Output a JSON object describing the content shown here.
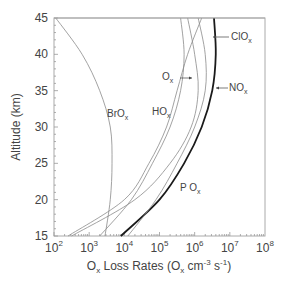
{
  "chart_data": {
    "type": "line",
    "title": "",
    "xlabel": "Ox Loss Rates (Ox cm-3 s-1)",
    "xlabel_parts": {
      "main": "O",
      "sub": "x",
      "rest": " Loss Rates  (O",
      "sub2": "x",
      "rest2": " cm",
      "sup": "-3",
      "rest3": " s",
      "sup2": "-1",
      "end": ")"
    },
    "ylabel": "Altitude (km)",
    "xscale": "log",
    "xlim": [
      100,
      100000000
    ],
    "ylim": [
      15,
      45
    ],
    "x_ticks": [
      {
        "base": "10",
        "exp": "2"
      },
      {
        "base": "10",
        "exp": "3"
      },
      {
        "base": "10",
        "exp": "4"
      },
      {
        "base": "10",
        "exp": "5"
      },
      {
        "base": "10",
        "exp": "6"
      },
      {
        "base": "10",
        "exp": "7"
      },
      {
        "base": "10",
        "exp": "8"
      }
    ],
    "y_ticks": [
      "15",
      "20",
      "25",
      "30",
      "35",
      "40",
      "45"
    ],
    "grid": false,
    "legend": "inline labels",
    "altitudes_km": [
      15,
      20,
      25,
      30,
      35,
      40,
      45
    ],
    "series": [
      {
        "name": "P Ox",
        "label_main": "P O",
        "label_sub": "x",
        "style": "thick",
        "log10_values": [
          3.9,
          5.0,
          5.7,
          6.2,
          6.5,
          6.6,
          6.55
        ]
      },
      {
        "name": "BrOx",
        "label_main": "BrO",
        "label_sub": "x",
        "style": "thin",
        "log10_values": [
          3.45,
          3.6,
          3.65,
          3.6,
          3.3,
          2.8,
          2.05
        ]
      },
      {
        "name": "ClOx",
        "label_main": "ClO",
        "label_sub": "x",
        "style": "thin",
        "log10_values": [
          2.5,
          4.3,
          5.3,
          5.9,
          6.1,
          6.0,
          5.8
        ]
      },
      {
        "name": "NOx",
        "label_main": "NO",
        "label_sub": "x",
        "style": "thin",
        "log10_values": [
          4.1,
          4.9,
          5.5,
          6.0,
          6.3,
          6.3,
          6.1
        ]
      },
      {
        "name": "HOx",
        "label_main": "HO",
        "label_sub": "x",
        "style": "thin",
        "log10_values": [
          2.4,
          4.0,
          4.7,
          5.2,
          5.5,
          5.8,
          6.2
        ]
      },
      {
        "name": "Ox",
        "label_main": "O",
        "label_sub": "x",
        "style": "thin",
        "log10_values": [
          3.3,
          4.2,
          4.8,
          5.3,
          5.6,
          5.7,
          5.6
        ]
      }
    ]
  },
  "colors": {
    "axis": "#999999",
    "thin_curve": "#8a8a8a",
    "thick_curve": "#1a1a1a",
    "text": "#444444"
  }
}
